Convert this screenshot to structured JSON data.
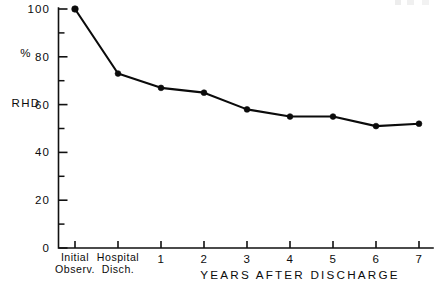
{
  "chart_data": {
    "type": "line",
    "title": "",
    "xlabel": "YEARS AFTER DISCHARGE",
    "ylabel": "% RHD",
    "ylabel_lines": [
      "%",
      "RHD"
    ],
    "categories": [
      "Initial\nObserv.",
      "Hospital\nDisch.",
      "1",
      "2",
      "3",
      "4",
      "5",
      "6",
      "7"
    ],
    "category_labels": [
      {
        "line1": "Initial",
        "line2": "Observ."
      },
      {
        "line1": "Hospital",
        "line2": "Disch."
      },
      {
        "line1": "1",
        "line2": ""
      },
      {
        "line1": "2",
        "line2": ""
      },
      {
        "line1": "3",
        "line2": ""
      },
      {
        "line1": "4",
        "line2": ""
      },
      {
        "line1": "5",
        "line2": ""
      },
      {
        "line1": "6",
        "line2": ""
      },
      {
        "line1": "7",
        "line2": ""
      }
    ],
    "values": [
      100,
      73,
      67,
      65,
      58,
      55,
      55,
      51,
      52
    ],
    "ylim": [
      0,
      100
    ],
    "ytick_labels": [
      "0",
      "20",
      "40",
      "60",
      "80",
      "100"
    ],
    "ytick_values": [
      0,
      20,
      40,
      60,
      80,
      100
    ],
    "yminor_values": [
      10,
      30,
      50,
      70,
      90
    ],
    "grid": false,
    "legend": "none",
    "marker": "filled-circle",
    "line_color": "#0b0b0b"
  },
  "colors": {
    "background": "#ffffff",
    "ink": "#111111",
    "series": "#0b0b0b"
  }
}
